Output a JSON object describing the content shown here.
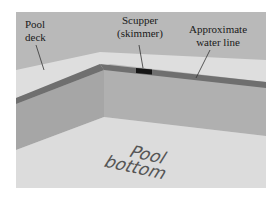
{
  "figure": {
    "labels": {
      "pool_deck": [
        "Pool",
        "deck"
      ],
      "scupper": [
        "Scupper",
        "(skimmer)"
      ],
      "water_line": [
        "Approximate",
        "water line"
      ],
      "pool_bottom": [
        "Pool",
        "bottom"
      ]
    },
    "colors": {
      "background": "#ffffff",
      "deck_back": "#b8b8b8",
      "deck_strip": "#dcdcdc",
      "water_line": "#6e6e6e",
      "scupper": "#1a1a1a",
      "wall_left": "#a9a9a9",
      "wall_back": "#b2b2b2",
      "floor": "#dadada",
      "leader_line": "#333333"
    }
  }
}
